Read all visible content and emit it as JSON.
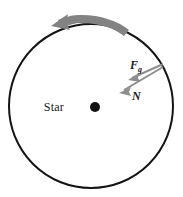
{
  "figure": {
    "type": "physics-free-body-diagram",
    "background_color": "#ffffff",
    "width": 183,
    "height": 197
  },
  "body": {
    "name": "star-circle",
    "shape": "circle",
    "center": {
      "x": 91,
      "y": 106
    },
    "radius": 82,
    "stroke_color": "#141414",
    "stroke_width": 2,
    "fill": "none"
  },
  "center_marker": {
    "name": "star-center-dot",
    "x": 95,
    "y": 107,
    "radius": 5,
    "color": "#111111"
  },
  "labels": {
    "star": {
      "text": "Star",
      "x": 64,
      "y": 111,
      "color": "#1a1a1a"
    },
    "gravity_force": {
      "text": "F",
      "subscript": "g",
      "x": 130,
      "y": 69,
      "color": "#1a1a1a"
    },
    "normal_force": {
      "text": "N",
      "subscript": "",
      "x": 132,
      "y": 100,
      "color": "#1a1a1a"
    }
  },
  "arrows": {
    "rotation": {
      "name": "rotation-arrow",
      "description": "curved arrow indicating counterclockwise rotation",
      "direction": "counterclockwise",
      "color": "#838383",
      "tip": {
        "x": 51,
        "y": 26
      },
      "tail": {
        "x": 129,
        "y": 29
      }
    },
    "gravity": {
      "name": "gravity-force-arrow",
      "label": "F_g",
      "color": "#8e8e8e",
      "tail": {
        "x": 163,
        "y": 64
      },
      "tip": {
        "x": 129,
        "y": 79
      },
      "stroke_width": 2
    },
    "normal": {
      "name": "normal-force-arrow",
      "label": "N",
      "color": "#8e8e8e",
      "tail": {
        "x": 163,
        "y": 67
      },
      "tip": {
        "x": 120,
        "y": 92
      },
      "stroke_width": 2
    }
  }
}
